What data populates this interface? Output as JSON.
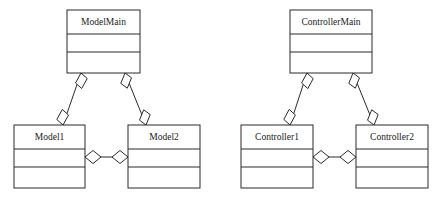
{
  "diagram": {
    "type": "uml-class-diagram",
    "title": "",
    "background_color": "#ffffff",
    "line_color": "#2b2b2b",
    "fill_color": "#ffffff",
    "text_color": "#1a1a1a",
    "groups": [
      {
        "id": "model-group",
        "name": "Model package",
        "classes": [
          {
            "id": "model-main",
            "name": "ModelMain",
            "x": 67,
            "y": 10,
            "width": 73,
            "height": 63,
            "name_band": 24,
            "attr_band": 18
          },
          {
            "id": "model-1",
            "name": "Model1",
            "x": 14,
            "y": 125,
            "width": 71,
            "height": 63,
            "name_band": 24,
            "attr_band": 18
          },
          {
            "id": "model-2",
            "name": "Model2",
            "x": 128,
            "y": 125,
            "width": 72,
            "height": 63,
            "name_band": 24,
            "attr_band": 18
          }
        ],
        "associations": [
          {
            "id": "modelmain-model1",
            "kind": "aggregation",
            "from": "ModelMain",
            "to": "Model1",
            "x1": 81,
            "y1": 73,
            "x2": 63,
            "y2": 125
          },
          {
            "id": "modelmain-model2",
            "kind": "aggregation",
            "from": "ModelMain",
            "to": "Model2",
            "x1": 125,
            "y1": 73,
            "x2": 146,
            "y2": 125
          },
          {
            "id": "model1-model2",
            "kind": "aggregation",
            "from": "Model1",
            "to": "Model2",
            "x1": 85,
            "y1": 157,
            "x2": 128,
            "y2": 157
          }
        ]
      },
      {
        "id": "controller-group",
        "name": "Controller package",
        "classes": [
          {
            "id": "controller-main",
            "name": "ControllerMain",
            "x": 290,
            "y": 10,
            "width": 82,
            "height": 63,
            "name_band": 24,
            "attr_band": 18
          },
          {
            "id": "controller-1",
            "name": "Controller1",
            "x": 241,
            "y": 125,
            "width": 72,
            "height": 63,
            "name_band": 24,
            "attr_band": 18
          },
          {
            "id": "controller-2",
            "name": "Controller2",
            "x": 356,
            "y": 125,
            "width": 72,
            "height": 63,
            "name_band": 24,
            "attr_band": 18
          }
        ],
        "associations": [
          {
            "id": "controllermain-controller1",
            "kind": "aggregation",
            "from": "ControllerMain",
            "to": "Controller1",
            "x1": 307,
            "y1": 73,
            "x2": 290,
            "y2": 125
          },
          {
            "id": "controllermain-controller2",
            "kind": "aggregation",
            "from": "ControllerMain",
            "to": "Controller2",
            "x1": 353,
            "y1": 73,
            "x2": 374,
            "y2": 125
          },
          {
            "id": "controller1-controller2",
            "kind": "aggregation",
            "from": "Controller1",
            "to": "Controller2",
            "x1": 313,
            "y1": 157,
            "x2": 356,
            "y2": 157
          }
        ]
      }
    ]
  }
}
